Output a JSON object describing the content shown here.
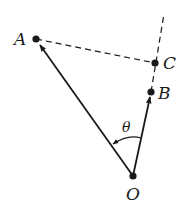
{
  "diagram": {
    "points": {
      "A": {
        "label": "A",
        "x": 36,
        "y": 39
      },
      "B": {
        "label": "B",
        "x": 151,
        "y": 92
      },
      "C": {
        "label": "C",
        "x": 155,
        "y": 63
      },
      "O": {
        "label": "O",
        "x": 133,
        "y": 176
      }
    },
    "angle_label": "θ",
    "vectors": [
      "O→A",
      "O→B"
    ],
    "dashed_lines": [
      "A–C",
      "line through O, B, C extended"
    ],
    "stroke_color": "#1a1a1a"
  }
}
